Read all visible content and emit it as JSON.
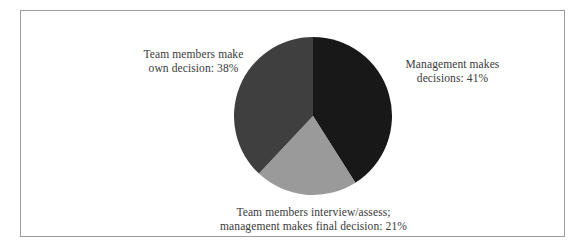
{
  "chart_data": {
    "type": "pie",
    "title": "",
    "subtitle": "",
    "xlabel": "",
    "ylabel": "",
    "legend_position": "none",
    "grid": false,
    "start_angle_deg": 0,
    "direction": "clockwise",
    "categories": [
      "Management makes decisions",
      "Team members interview/assess; management makes final decision",
      "Team members make own decision"
    ],
    "values": [
      41,
      21,
      38
    ],
    "unit": "%",
    "colors": [
      "#181818",
      "#9a9a9a",
      "#3f3f3f"
    ],
    "slices": [
      {
        "name": "Management makes decisions",
        "value": 41,
        "label_line1": "Management makes",
        "label_line2": "decisions: 41%",
        "color": "#181818",
        "start_deg": 0,
        "end_deg": 147.6
      },
      {
        "name": "Team members interview/assess; management makes final decision",
        "value": 21,
        "label_line1": "Team members interview/assess;",
        "label_line2": "management makes final decision: 21%",
        "color": "#9a9a9a",
        "start_deg": 147.6,
        "end_deg": 223.2
      },
      {
        "name": "Team members make own decision",
        "value": 38,
        "label_line1": "Team members make",
        "label_line2": "own decision: 38%",
        "color": "#3f3f3f",
        "start_deg": 223.2,
        "end_deg": 360
      }
    ],
    "annotations": [
      "Team members make own decision: 38%",
      "Management makes decisions: 41%",
      "Team members interview/assess; management makes final decision: 21%"
    ]
  },
  "figure": {
    "background_color": "#ffffff",
    "border_color": "#9b9b9b",
    "text_color": "#3a3a3a"
  }
}
